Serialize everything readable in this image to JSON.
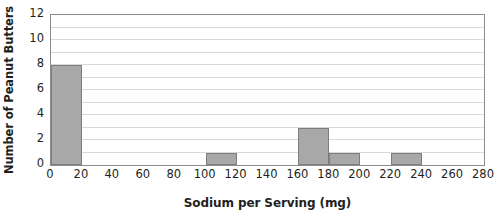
{
  "chart_data": {
    "type": "bar",
    "title": "",
    "subtitle": "",
    "xlabel": "Sodium per Serving (mg)",
    "ylabel": "Number of Peanut Butters",
    "xlim": [
      0,
      280
    ],
    "ylim": [
      0,
      12
    ],
    "x_tick_labels": [
      "0",
      "20",
      "40",
      "60",
      "80",
      "100",
      "120",
      "140",
      "160",
      "180",
      "200",
      "220",
      "240",
      "260",
      "280"
    ],
    "x_tick_values": [
      0,
      20,
      40,
      60,
      80,
      100,
      120,
      140,
      160,
      180,
      200,
      220,
      240,
      260,
      280
    ],
    "y_tick_labels": [
      "0",
      "2",
      "4",
      "6",
      "8",
      "10",
      "12"
    ],
    "y_tick_values": [
      0,
      2,
      4,
      6,
      8,
      10,
      12
    ],
    "gridlines": {
      "horizontal": true,
      "vertical": false,
      "horizontal_step": 1,
      "horizontal_values": [
        1,
        2,
        3,
        4,
        5,
        6,
        7,
        8,
        9,
        10,
        11,
        12
      ]
    },
    "legend": {
      "visible": false,
      "position": "none"
    },
    "bin_width": 20,
    "categories": [
      "0-20",
      "20-40",
      "40-60",
      "60-80",
      "80-100",
      "100-120",
      "120-140",
      "140-160",
      "160-180",
      "180-200",
      "200-220",
      "220-240",
      "240-260",
      "260-280"
    ],
    "bins": [
      {
        "start": 0,
        "end": 20,
        "count": 8
      },
      {
        "start": 20,
        "end": 40,
        "count": 0
      },
      {
        "start": 40,
        "end": 60,
        "count": 0
      },
      {
        "start": 60,
        "end": 80,
        "count": 0
      },
      {
        "start": 80,
        "end": 100,
        "count": 0
      },
      {
        "start": 100,
        "end": 120,
        "count": 1
      },
      {
        "start": 120,
        "end": 140,
        "count": 0
      },
      {
        "start": 140,
        "end": 160,
        "count": 0
      },
      {
        "start": 160,
        "end": 180,
        "count": 3
      },
      {
        "start": 180,
        "end": 200,
        "count": 1
      },
      {
        "start": 200,
        "end": 220,
        "count": 0
      },
      {
        "start": 220,
        "end": 240,
        "count": 1
      },
      {
        "start": 240,
        "end": 260,
        "count": 0
      },
      {
        "start": 260,
        "end": 280,
        "count": 0
      }
    ],
    "values": [
      8,
      0,
      0,
      0,
      0,
      1,
      0,
      0,
      3,
      1,
      0,
      1,
      0,
      0
    ],
    "total_count": 14,
    "colors": {
      "bar_fill": "#a8a8a8",
      "bar_border": "#7d7d7d",
      "gridline": "#d9d9d9",
      "plot_border": "#8c8c8c",
      "background": "#ffffff",
      "text": "#231f20"
    }
  }
}
